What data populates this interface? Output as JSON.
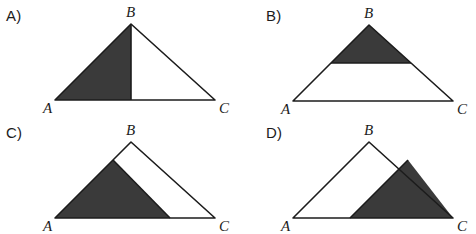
{
  "figure": {
    "background_color": "#ffffff",
    "shade_color": "#3a3a3a",
    "outline_color": "#1c1c1c"
  },
  "panels": [
    {
      "id": "A",
      "label": "A)",
      "vertices": {
        "A": "A",
        "B": "B",
        "C": "C"
      },
      "geometry": {
        "A": [
          55,
          100
        ],
        "B": [
          131,
          24
        ],
        "C": [
          215,
          100
        ],
        "cut_line": "altitude from B to foot on AC",
        "foot": [
          131,
          100
        ]
      },
      "shaded_region": [
        "A",
        "B",
        "foot"
      ],
      "shaded_description": "left sub-triangle A-B-foot formed by the altitude from B"
    },
    {
      "id": "B",
      "label": "B)",
      "vertices": {
        "A": "A",
        "B": "B",
        "C": "C"
      },
      "geometry": {
        "A": [
          293,
          101
        ],
        "B": [
          369,
          25
        ],
        "C": [
          453,
          101
        ],
        "cut_line": "horizontal line parallel to AC",
        "left_point": [
          331,
          63
        ],
        "right_point": [
          411,
          63
        ]
      },
      "shaded_region": [
        "left_point",
        "B",
        "right_point"
      ],
      "shaded_description": "upper sub-triangle above a horizontal line parallel to base AC"
    },
    {
      "id": "C",
      "label": "C)",
      "vertices": {
        "A": "A",
        "B": "B",
        "C": "C"
      },
      "geometry": {
        "A": [
          55,
          218
        ],
        "B": [
          131,
          142
        ],
        "C": [
          215,
          218
        ],
        "point_on_AB": [
          113,
          160
        ],
        "point_on_AC": [
          170,
          218
        ]
      },
      "shaded_region": [
        "A",
        "point_on_AB",
        "point_on_AC"
      ],
      "shaded_description": "triangle from vertex A to a point on AB and a point on base AC"
    },
    {
      "id": "D",
      "label": "D)",
      "vertices": {
        "A": "A",
        "B": "B",
        "C": "C"
      },
      "geometry": {
        "A": [
          293,
          218
        ],
        "B": [
          369,
          142
        ],
        "C": [
          453,
          218
        ],
        "point_on_AC": [
          350,
          218
        ],
        "point_on_BC": [
          408,
          160
        ]
      },
      "shaded_region": [
        "point_on_AC",
        "point_on_BC",
        "C"
      ],
      "shaded_description": "triangle from a point on base AC to a point on BC and vertex C"
    }
  ]
}
